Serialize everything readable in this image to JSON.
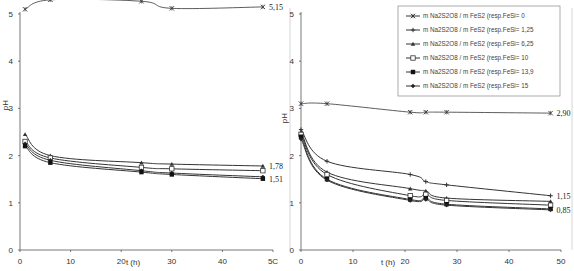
{
  "chart_data": [
    {
      "type": "line",
      "title": "",
      "xlabel": "t (h)",
      "ylabel": "pH",
      "xlim": [
        0,
        50
      ],
      "ylim": [
        0,
        5
      ],
      "xticks": [
        "0",
        "10",
        "20",
        "30",
        "40",
        "5C"
      ],
      "yticks": [
        "0",
        "1",
        "2",
        "3",
        "4",
        "5"
      ],
      "grid": false,
      "x": [
        1,
        6,
        24,
        30,
        48
      ],
      "series": [
        {
          "name": "series-1",
          "values": [
            5.1,
            5.3,
            5.27,
            5.12,
            5.15
          ],
          "marker": "x",
          "end_label": "5,15"
        },
        {
          "name": "series-2",
          "values": [
            2.45,
            2.0,
            1.85,
            1.82,
            1.78
          ],
          "marker": "triangle",
          "end_label": "1,78"
        },
        {
          "name": "series-3",
          "values": [
            2.3,
            1.95,
            1.75,
            1.72,
            1.68
          ],
          "marker": "open-square",
          "end_label": ""
        },
        {
          "name": "series-4",
          "values": [
            2.25,
            1.9,
            1.68,
            1.63,
            1.55
          ],
          "marker": "diamond",
          "end_label": ""
        },
        {
          "name": "series-5",
          "values": [
            2.2,
            1.85,
            1.65,
            1.6,
            1.51
          ],
          "marker": "square",
          "end_label": "1,51"
        }
      ],
      "legend": null
    },
    {
      "type": "line",
      "title": "",
      "xlabel": "t (h)",
      "ylabel": "pH",
      "xlim": [
        0,
        50
      ],
      "ylim": [
        0,
        5
      ],
      "xticks": [
        "0",
        "10",
        "20",
        "30",
        "40",
        "50"
      ],
      "yticks": [
        "0",
        "1",
        "2",
        "3",
        "4",
        "5"
      ],
      "grid": false,
      "x": [
        0,
        5,
        21,
        24,
        28,
        48
      ],
      "series": [
        {
          "name": "m Na2S2O8 / m FeS2 (resp.FeSi= 0",
          "values": [
            3.1,
            3.1,
            2.92,
            2.92,
            2.92,
            2.9
          ],
          "marker": "x",
          "end_label": "2,90"
        },
        {
          "name": "m Na2S2O8 / m FeS2 (resp.FeSi= 1,25",
          "values": [
            2.55,
            1.88,
            1.6,
            1.45,
            1.38,
            1.15
          ],
          "marker": "plus",
          "end_label": "1,15"
        },
        {
          "name": "m Na2S2O8 / m FeS2 (resp.FeSi= 6,25",
          "values": [
            2.5,
            1.65,
            1.3,
            1.25,
            1.1,
            1.03
          ],
          "marker": "triangle",
          "end_label": ""
        },
        {
          "name": "m Na2S2O8 / m FeS2 (resp.FeSi= 10",
          "values": [
            2.45,
            1.6,
            1.15,
            1.18,
            1.05,
            0.95
          ],
          "marker": "open-square",
          "end_label": ""
        },
        {
          "name": "m Na2S2O8 / m FeS2 (resp.FeSi= 13,9",
          "values": [
            2.4,
            1.5,
            1.07,
            1.1,
            0.97,
            0.87
          ],
          "marker": "square",
          "end_label": ""
        },
        {
          "name": "m Na2S2O8 / m FeS2 (resp.FeSi= 15",
          "values": [
            2.35,
            1.48,
            1.05,
            1.07,
            0.95,
            0.85
          ],
          "marker": "diamond",
          "end_label": "0,85"
        }
      ],
      "legend": {
        "position": "top-right",
        "entries": [
          "m Na2S2O8 / m FeS2 (resp.FeSi= 0",
          "m Na2S2O8 / m FeS2 (resp.FeSi= 1,25",
          "m Na2S2O8 / m FeS2 (resp.FeSi= 6,25",
          "m Na2S2O8 / m FeS2 (resp.FeSi= 10",
          "m Na2S2O8 / m FeS2 (resp.FeSi= 13,9",
          "m Na2S2O8 / m FeS2 (resp.FeSi= 15"
        ]
      }
    }
  ],
  "colors": {
    "line": "#333333",
    "axis": "#555555",
    "frame": "#cccccc"
  }
}
